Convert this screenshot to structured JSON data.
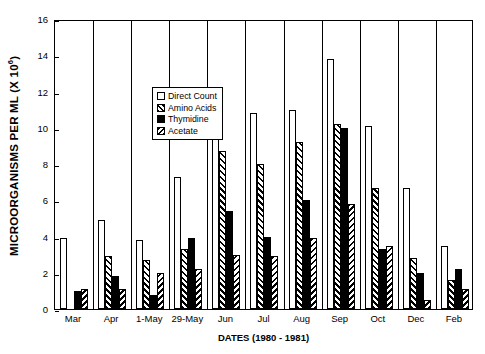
{
  "chart_data": {
    "type": "bar",
    "title": "",
    "xlabel": "DATES (1980 - 1981)",
    "ylabel": "MICROORGANISMS PER ML (X 10",
    "ylabel_exponent": "6",
    "ylabel_close": ")",
    "categories": [
      "Mar",
      "Apr",
      "1-May",
      "29-May",
      "Jun",
      "Jul",
      "Aug",
      "Sep",
      "Oct",
      "Dec",
      "Feb"
    ],
    "ylim": [
      0,
      16
    ],
    "yticks": [
      0,
      2,
      4,
      6,
      8,
      10,
      12,
      14,
      16
    ],
    "ytick_labels": [
      "0",
      "2",
      "4",
      "6",
      "8",
      "10",
      "12",
      "14",
      "16"
    ],
    "grid": false,
    "legend_position": "upper left inside",
    "series": [
      {
        "name": "Direct Count",
        "fill": "open-white",
        "values": [
          3.9,
          4.9,
          3.8,
          7.3,
          10.0,
          10.8,
          11.0,
          13.8,
          10.1,
          6.7,
          3.5
        ]
      },
      {
        "name": "Amino Acids",
        "fill": "forward-hatch",
        "values": [
          null,
          2.9,
          2.7,
          3.3,
          8.7,
          8.0,
          9.2,
          10.2,
          6.7,
          2.8,
          1.6
        ]
      },
      {
        "name": "Thymidine",
        "fill": "solid-black",
        "values": [
          1.0,
          1.8,
          0.8,
          3.9,
          5.4,
          4.0,
          6.0,
          10.0,
          3.3,
          2.0,
          2.2
        ]
      },
      {
        "name": "Acetate",
        "fill": "back-hatch",
        "values": [
          1.1,
          1.1,
          2.0,
          2.2,
          3.0,
          2.9,
          3.9,
          5.8,
          3.5,
          0.5,
          1.1
        ]
      }
    ]
  },
  "colors": {
    "axis": "#000000",
    "background": "#ffffff",
    "bar_outline": "#000000",
    "series_direct_count": "#ffffff",
    "series_thymidine": "#000000"
  }
}
